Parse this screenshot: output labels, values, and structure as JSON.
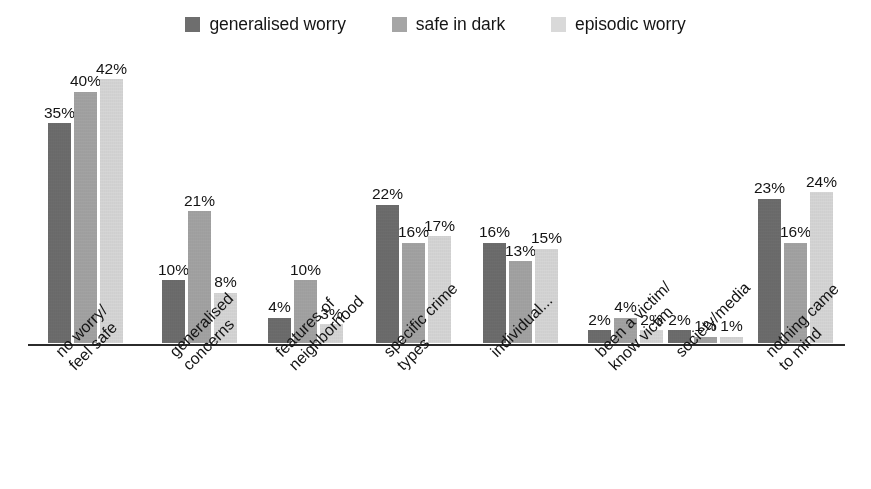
{
  "chart_data": {
    "type": "bar",
    "title": "",
    "subtitle": "",
    "xlabel": "",
    "ylabel": "",
    "ylim": [
      0,
      45
    ],
    "grid": false,
    "legend_position": "top-center",
    "value_suffix": "%",
    "categories": [
      {
        "line1": "no worry/",
        "line2": "feel safe"
      },
      {
        "line1": "generalised",
        "line2": "concerns"
      },
      {
        "line1": "features of",
        "line2": "neighborhood"
      },
      {
        "line1": "specific crime",
        "line2": "types"
      },
      {
        "line1": "individual...",
        "line2": ""
      },
      {
        "line1": "been a victim/",
        "line2": "know victim"
      },
      {
        "line1": "society/media",
        "line2": ""
      },
      {
        "line1": "nothing came",
        "line2": "to mind"
      }
    ],
    "series": [
      {
        "name": "generalised worry",
        "color": "#6e6e6e",
        "values": [
          35,
          10,
          4,
          22,
          16,
          2,
          2,
          23
        ],
        "labels": [
          "35%",
          "10%",
          "4%",
          "22%",
          "16%",
          "2%",
          "2%",
          "23%"
        ]
      },
      {
        "name": "safe in dark",
        "color": "#a5a5a5",
        "values": [
          40,
          21,
          10,
          16,
          13,
          4,
          1,
          16
        ],
        "labels": [
          "40%",
          "21%",
          "10%",
          "16%",
          "13%",
          "4%",
          "1%",
          "16%"
        ]
      },
      {
        "name": "episodic worry",
        "color": "#d9d9d9",
        "values": [
          42,
          8,
          3,
          17,
          15,
          2,
          1,
          24
        ],
        "labels": [
          "42%",
          "8%",
          "3%",
          "17%",
          "15%",
          "2%",
          "1%",
          "24%"
        ]
      }
    ]
  },
  "legend": {
    "items": [
      {
        "label": "generalised worry",
        "color": "#6e6e6e"
      },
      {
        "label": "safe in dark",
        "color": "#a5a5a5"
      },
      {
        "label": "episodic worry",
        "color": "#d9d9d9"
      }
    ]
  },
  "axis": {
    "baseline_color": "#2b2b2b"
  },
  "layout": {
    "group_left_positions": [
      20,
      134,
      240,
      348,
      455,
      560,
      640,
      730
    ],
    "px_per_unit": 6.28
  }
}
